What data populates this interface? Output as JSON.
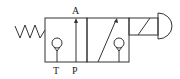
{
  "diagram": {
    "type": "3/2 directional control valve symbol",
    "ports": {
      "A": "A",
      "T": "T",
      "P": "P"
    },
    "actuators": {
      "left": "spring-return",
      "right": "solenoid-with-pushbutton"
    },
    "colors": {
      "stroke": "#333333",
      "background": "#ffffff"
    }
  }
}
